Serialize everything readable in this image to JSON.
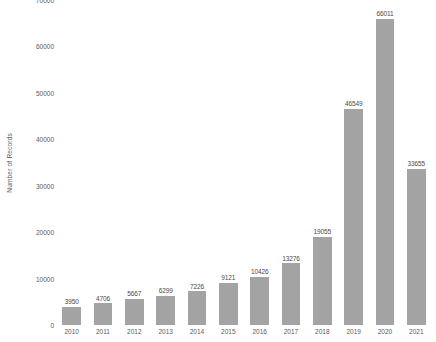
{
  "chart_data": {
    "type": "bar",
    "title": "",
    "subtitle": "",
    "xlabel": "",
    "ylabel": "Number of Records",
    "categories": [
      "2010",
      "2011",
      "2012",
      "2013",
      "2014",
      "2015",
      "2016",
      "2017",
      "2018",
      "2019",
      "2020",
      "2021"
    ],
    "values": [
      3950,
      4706,
      5667,
      6299,
      7226,
      9121,
      10426,
      13276,
      19055,
      46549,
      66011,
      33655
    ],
    "data_labels": [
      "3950",
      "4706",
      "5667",
      "6299",
      "7226",
      "9121",
      "10426",
      "13276",
      "19055",
      "46549",
      "66011",
      "33655"
    ],
    "ylim": [
      0,
      70000
    ],
    "y_ticks": [
      0,
      10000,
      20000,
      30000,
      40000,
      50000,
      60000,
      70000
    ],
    "y_tick_labels": [
      "0",
      "10000",
      "20000",
      "30000",
      "40000",
      "50000",
      "60000",
      "70000"
    ],
    "grid": false,
    "legend": false,
    "legend_position": "none",
    "bar_color": "#a3a3a3",
    "text_color": "#5a5a5a",
    "background_color": "#ffffff",
    "show_data_labels": true
  }
}
